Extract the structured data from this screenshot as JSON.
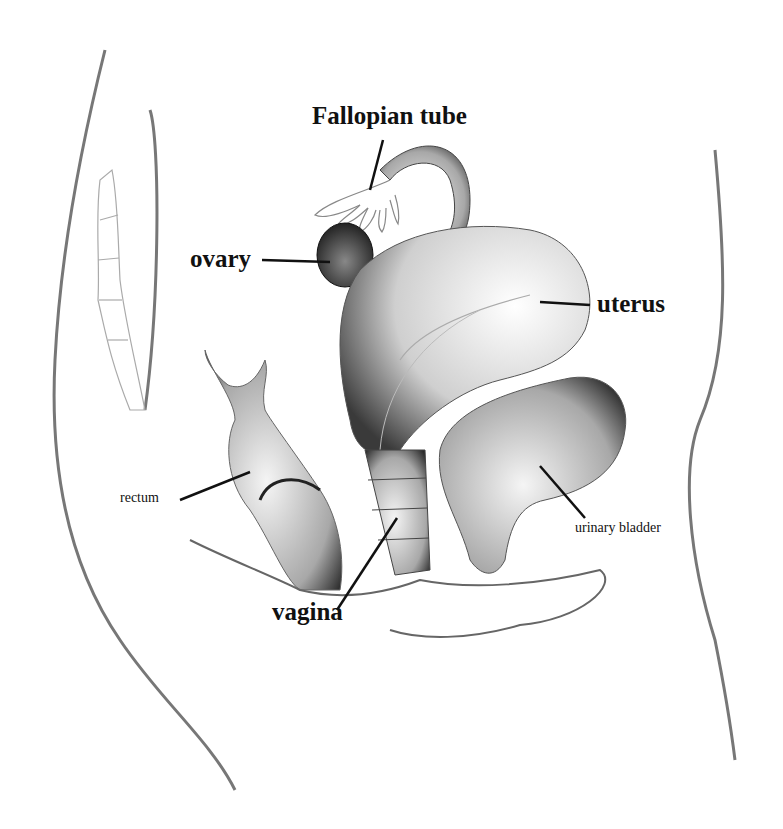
{
  "diagram": {
    "type": "anatomical-illustration",
    "labels": {
      "fallopian_tube": "Fallopian tube",
      "ovary": "ovary",
      "uterus": "uterus",
      "rectum": "rectum",
      "urinary_bladder": "urinary bladder",
      "vagina": "vagina"
    },
    "colors": {
      "line": "#111111",
      "shade": "#555555",
      "background": "#ffffff"
    }
  }
}
